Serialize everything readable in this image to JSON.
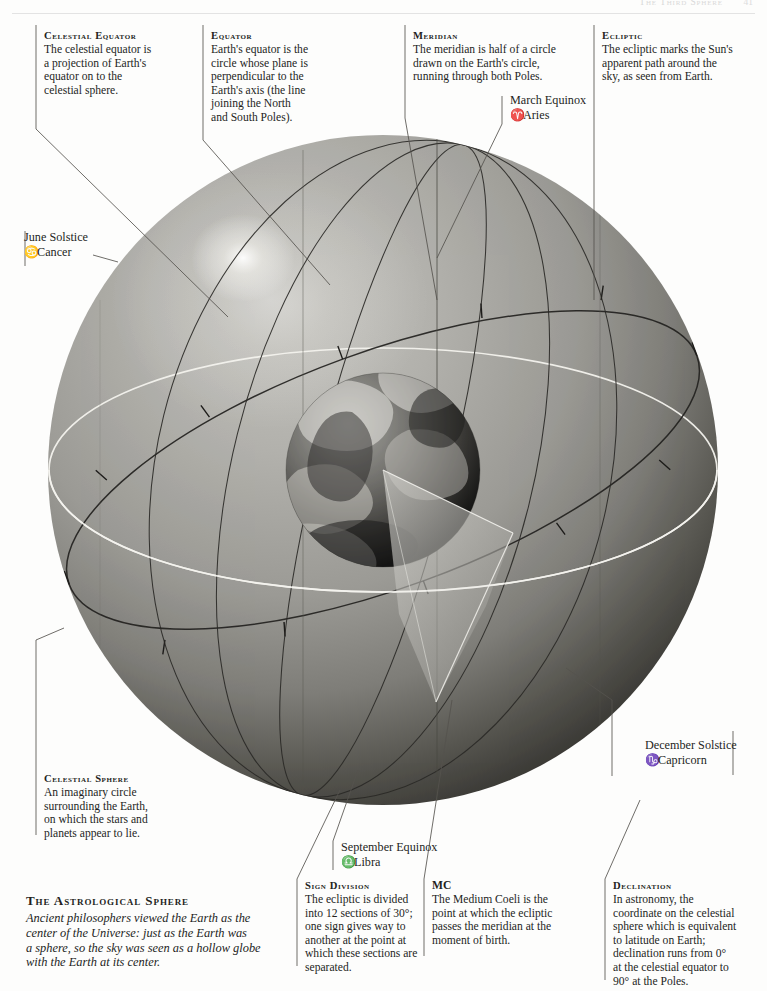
{
  "page": {
    "header_title": "The Third Sphere",
    "folio": "41"
  },
  "colophon": {
    "title": "The Astrological Sphere",
    "lines": [
      "Ancient philosophers viewed the Earth as the",
      "center of the Universe: just as the Earth was",
      "a sphere, so the sky was seen as a hollow globe",
      "with the Earth at its center."
    ]
  },
  "notes": {
    "celestial_equator": {
      "heading": "Celestial Equator",
      "lines": [
        "The celestial equator is",
        "a projection of Earth's",
        "equator on to the",
        "celestial sphere."
      ]
    },
    "equator": {
      "heading": "Equator",
      "lines": [
        "Earth's equator is the",
        "circle whose plane is",
        "perpendicular to the",
        "Earth's axis (the line",
        "joining the North",
        "and South Poles)."
      ]
    },
    "meridian": {
      "heading": "Meridian",
      "lines": [
        "The meridian is half of a circle",
        "drawn on the Earth's circle,",
        "running through both Poles."
      ]
    },
    "ecliptic": {
      "heading": "Ecliptic",
      "lines": [
        "The ecliptic marks the Sun's",
        "apparent path around the",
        "sky, as seen from Earth."
      ]
    },
    "celestial_sphere": {
      "heading": "Celestial Sphere",
      "lines": [
        "An imaginary circle",
        "surrounding the Earth,",
        "on which the stars and",
        "planets appear to lie."
      ]
    },
    "sign_division": {
      "heading": "Sign Division",
      "lines": [
        "The ecliptic is divided",
        "into 12 sections of 30°;",
        "one sign gives way to",
        "another at the point at",
        "which these sections are",
        "separated."
      ]
    },
    "mc": {
      "heading": "MC",
      "lines": [
        "The Medium Coeli is the",
        "point at which the ecliptic",
        "passes the meridian at the",
        "moment of birth."
      ]
    },
    "declination": {
      "heading": "Declination",
      "lines": [
        "In astronomy, the",
        "coordinate on the celestial",
        "sphere which is equivalent",
        "to latitude on Earth;",
        "declination runs from 0°",
        "at the celestial equator to",
        "90° at the Poles."
      ]
    }
  },
  "markers": {
    "march_equinox": {
      "title": "March Equinox",
      "glyph": "♈",
      "sign": "Aries"
    },
    "june_solstice": {
      "title": "June Solstice",
      "glyph": "♋",
      "sign": "Cancer"
    },
    "september_equinox": {
      "title": "September Equinox",
      "glyph": "♎",
      "sign": "Libra"
    },
    "december_solstice": {
      "title": "December Solstice",
      "glyph": "♑",
      "sign": "Capricorn"
    }
  },
  "colors": {
    "sphere_light": "#b4b3ae",
    "sphere_mid": "#8e8d88",
    "sphere_dark": "#3a3936",
    "ecliptic_line": "#f2f1ec",
    "meridian_line": "#2b2a27",
    "ink": "#241f1c"
  }
}
